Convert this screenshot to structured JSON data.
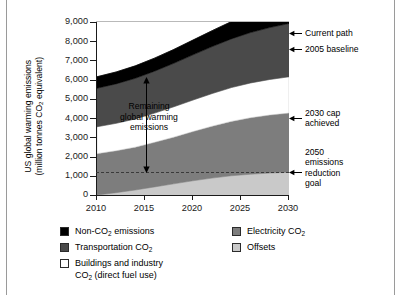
{
  "axes": {
    "ylabel_line1": "US global warming emissions",
    "ylabel_line2": "(million tonnes CO2 equivalent)",
    "ylabel_line2_pre": "(million tonnes CO",
    "ylabel_line2_sub": "2",
    "ylabel_line2_post": " equivalent)",
    "yticks": [
      "9,000",
      "8,000",
      "7,000",
      "6,000",
      "5,000",
      "4,000",
      "3,000",
      "2,000",
      "1,000",
      "0"
    ],
    "ytick_values": [
      9000,
      8000,
      7000,
      6000,
      5000,
      4000,
      3000,
      2000,
      1000,
      0
    ],
    "xticks": [
      "2010",
      "2015",
      "2020",
      "2025",
      "2030"
    ],
    "xtick_values": [
      2010,
      2015,
      2020,
      2025,
      2030
    ]
  },
  "annotations": {
    "remaining_l1": "Remaining",
    "remaining_l2": "global warming",
    "remaining_l3": "emissions",
    "current_path": "Current path",
    "baseline_2005": "2005 baseline",
    "cap_2030_l1": "2030 cap",
    "cap_2030_l2": "achieved",
    "goal_2050_l1": "2050",
    "goal_2050_l2": "emissions",
    "goal_2050_l3": "reduction",
    "goal_2050_l4": "goal"
  },
  "legend": {
    "left": [
      {
        "label": "Non-CO2 emissions",
        "pre": "Non-CO",
        "sub": "2",
        "post": " emissions",
        "color": "#000000"
      },
      {
        "label": "Transportation CO2",
        "pre": "Transportation CO",
        "sub": "2",
        "post": "",
        "color": "#4a4a4a"
      },
      {
        "label": "Buildings and industry CO2 (direct fuel use)",
        "pre": "Buildings and industry",
        "sub": "",
        "post": "",
        "color": "#ffffff",
        "line2_pre": "CO",
        "line2_sub": "2",
        "line2_post": " (direct fuel use)"
      }
    ],
    "right": [
      {
        "label": "Electricity CO2",
        "pre": "Electricity CO",
        "sub": "2",
        "post": "",
        "color": "#7d7d7d"
      },
      {
        "label": "Offsets",
        "pre": "Offsets",
        "sub": "",
        "post": "",
        "color": "#c9c9c9"
      }
    ]
  },
  "colors": {
    "non_co2": "#000000",
    "transportation_co2": "#4a4a4a",
    "buildings_industry_co2": "#ffffff",
    "electricity_co2": "#7d7d7d",
    "offsets": "#c9c9c9",
    "axis": "#1a1a1a",
    "frame": "#9a9a9a",
    "goal_line": "#3a3a3a"
  },
  "chart_data": {
    "type": "area",
    "title": "",
    "xlabel": "",
    "ylabel": "US global warming emissions (million tonnes CO2 equivalent)",
    "xlim": [
      2010,
      2030
    ],
    "ylim": [
      0,
      9000
    ],
    "grid": false,
    "legend_position": "below",
    "stacked": true,
    "x": [
      2010,
      2012,
      2014,
      2016,
      2018,
      2020,
      2022,
      2024,
      2026,
      2028,
      2030
    ],
    "series": [
      {
        "name": "Offsets",
        "color": "#c9c9c9",
        "values": [
          0,
          120,
          260,
          420,
          580,
          740,
          880,
          1000,
          1080,
          1140,
          1180
        ]
      },
      {
        "name": "Electricity CO2",
        "color": "#7d7d7d",
        "values": [
          2150,
          2180,
          2230,
          2320,
          2430,
          2560,
          2700,
          2830,
          2940,
          3020,
          3080
        ]
      },
      {
        "name": "Buildings and industry CO2 (direct fuel use)",
        "color": "#ffffff",
        "values": [
          1400,
          1430,
          1470,
          1520,
          1580,
          1640,
          1700,
          1760,
          1810,
          1850,
          1890
        ]
      },
      {
        "name": "Transportation CO2",
        "color": "#4a4a4a",
        "values": [
          2000,
          2050,
          2110,
          2180,
          2260,
          2350,
          2440,
          2530,
          2620,
          2700,
          2770
        ]
      },
      {
        "name": "Non-CO2 emissions",
        "color": "#000000",
        "values": [
          600,
          620,
          650,
          680,
          720,
          770,
          830,
          900,
          980,
          1060,
          1140
        ]
      }
    ],
    "reference_lines": [
      {
        "name": "2005 baseline",
        "y": 7000,
        "orientation": "horizontal",
        "style": "implicit-top-of-white-band"
      },
      {
        "name": "2050 emissions reduction goal",
        "y": 1200,
        "orientation": "horizontal",
        "style": "dashed"
      }
    ],
    "callouts": [
      {
        "name": "Current path",
        "x": 2030,
        "y": 8420
      },
      {
        "name": "2005 baseline",
        "x": 2030,
        "y": 7900
      },
      {
        "name": "2030 cap achieved",
        "x": 2030,
        "y": 3180
      },
      {
        "name": "2050 emissions reduction goal",
        "x": 2030,
        "y": 1200
      },
      {
        "name": "Remaining global warming emissions",
        "x": 2015,
        "y": 3200
      }
    ]
  }
}
